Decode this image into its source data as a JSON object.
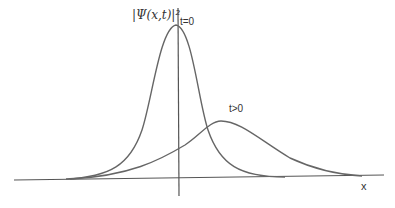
{
  "figure": {
    "y_label": "|Ψ(x,t)|²",
    "x_label": "x",
    "curves": [
      {
        "label": "t=0",
        "description": "narrow tall peak centered at origin"
      },
      {
        "label": "t>0",
        "description": "broad lower peak shifted to the right"
      }
    ],
    "colors": {
      "axes": "#444444",
      "curve": "#666666"
    }
  }
}
